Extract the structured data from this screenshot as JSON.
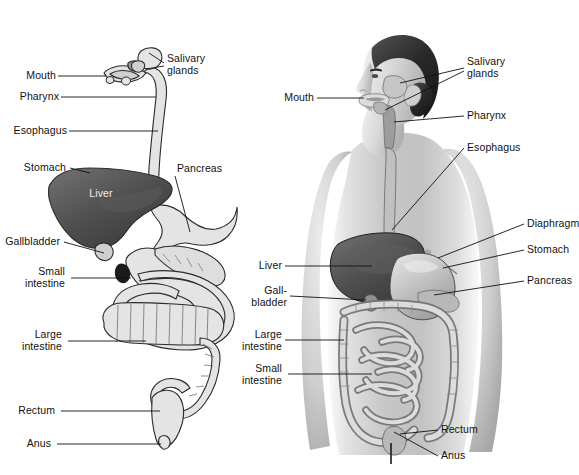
{
  "figure": {
    "panels": [
      {
        "id": "schematic",
        "name": "Schematic digestive tract",
        "labels": [
          {
            "key": "mouth",
            "text": "Mouth"
          },
          {
            "key": "salivary_glands",
            "text": "Salivary\nglands"
          },
          {
            "key": "pharynx",
            "text": "Pharynx"
          },
          {
            "key": "esophagus",
            "text": "Esophagus"
          },
          {
            "key": "stomach",
            "text": "Stomach"
          },
          {
            "key": "liver",
            "text": "Liver"
          },
          {
            "key": "pancreas",
            "text": "Pancreas"
          },
          {
            "key": "gallbladder",
            "text": "Gallbladder"
          },
          {
            "key": "small_intestine",
            "text": "Small\nintestine"
          },
          {
            "key": "large_intestine",
            "text": "Large\nintestine"
          },
          {
            "key": "rectum",
            "text": "Rectum"
          },
          {
            "key": "anus",
            "text": "Anus"
          }
        ]
      },
      {
        "id": "body",
        "name": "Digestive organs in the body",
        "labels": [
          {
            "key": "mouth",
            "text": "Mouth"
          },
          {
            "key": "salivary_glands",
            "text": "Salivary\nglands"
          },
          {
            "key": "pharynx",
            "text": "Pharynx"
          },
          {
            "key": "esophagus",
            "text": "Esophagus"
          },
          {
            "key": "diaphragm",
            "text": "Diaphragm"
          },
          {
            "key": "stomach",
            "text": "Stomach"
          },
          {
            "key": "pancreas",
            "text": "Pancreas"
          },
          {
            "key": "liver",
            "text": "Liver"
          },
          {
            "key": "gallbladder",
            "text": "Gall-\nbladder"
          },
          {
            "key": "large_intestine",
            "text": "Large\nintestine"
          },
          {
            "key": "small_intestine",
            "text": "Small\nintestine"
          },
          {
            "key": "rectum",
            "text": "Rectum"
          },
          {
            "key": "anus",
            "text": "Anus"
          }
        ]
      }
    ],
    "colors": {
      "background": "#ffffff",
      "liver_dark": "#6b6b6b",
      "organ_light": "#e2e2e2",
      "outline": "#2b2b2b",
      "leader_line": "#111111",
      "skin_light": "#e9e9e9",
      "skin_mid": "#c9c9c9",
      "skin_shadow": "#9a9a9a",
      "hair_dark": "#2a2a2a",
      "gut_mid": "#b4b4b4",
      "label_text": "#111111"
    },
    "footer_text": ""
  }
}
